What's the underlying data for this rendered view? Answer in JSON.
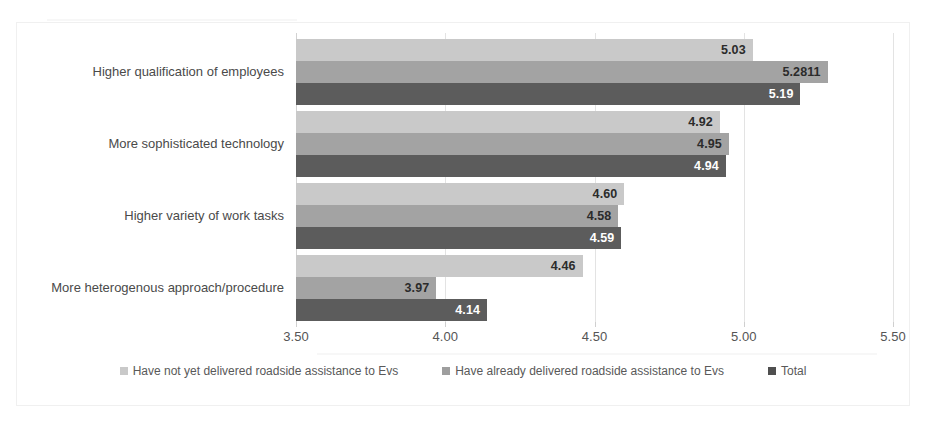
{
  "chart_data": {
    "type": "bar",
    "orientation": "horizontal",
    "title": "",
    "xlabel": "",
    "ylabel": "",
    "xlim": [
      3.5,
      5.5
    ],
    "xticks": [
      "3.50",
      "4.00",
      "4.50",
      "5.00",
      "5.50"
    ],
    "xtick_values": [
      3.5,
      4.0,
      4.5,
      5.0,
      5.5
    ],
    "grid": true,
    "legend_position": "bottom",
    "categories": [
      "Higher qualification of employees",
      "More sophisticated technology",
      "Higher variety of work tasks",
      "More heterogenous approach/procedure"
    ],
    "series": [
      {
        "name": "Have not yet delivered roadside assistance to Evs",
        "color": "#c9c9c9",
        "values": [
          5.03,
          4.92,
          4.6,
          4.46
        ],
        "labels": [
          "5.03",
          "4.92",
          "4.60",
          "4.46"
        ]
      },
      {
        "name": "Have already delivered roadside assistance to Evs",
        "color": "#a3a3a3",
        "values": [
          5.2811,
          4.95,
          4.58,
          3.97
        ],
        "labels": [
          "5.2811",
          "4.95",
          "4.58",
          "3.97"
        ]
      },
      {
        "name": "Total",
        "color": "#5c5c5c",
        "values": [
          5.19,
          4.94,
          4.59,
          4.14
        ],
        "labels": [
          "5.19",
          "4.94",
          "4.59",
          "4.14"
        ]
      }
    ]
  },
  "legend": {
    "items": [
      {
        "label": "Have not yet delivered roadside assistance to Evs",
        "color": "#c9c9c9"
      },
      {
        "label": "Have already delivered roadside assistance to Evs",
        "color": "#9e9e9e"
      },
      {
        "label": "Total",
        "color": "#4f4f4f"
      }
    ]
  }
}
